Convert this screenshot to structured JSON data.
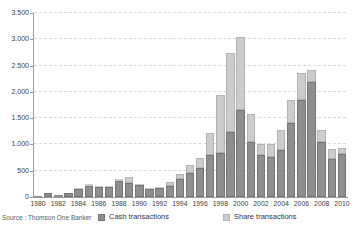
{
  "chart_data": {
    "type": "bar",
    "stacked": true,
    "title": "",
    "xlabel": "",
    "ylabel": "",
    "categories": [
      1980,
      1981,
      1982,
      1983,
      1984,
      1985,
      1986,
      1987,
      1988,
      1989,
      1990,
      1991,
      1992,
      1993,
      1994,
      1995,
      1996,
      1997,
      1998,
      1999,
      2000,
      2001,
      2002,
      2003,
      2004,
      2005,
      2006,
      2007,
      2008,
      2009,
      2010
    ],
    "series": [
      {
        "name": "Cash transactions",
        "color": "#8e8e8e",
        "border_color": "#747474",
        "values": [
          10,
          80,
          30,
          70,
          160,
          205,
          195,
          195,
          310,
          275,
          225,
          145,
          175,
          215,
          345,
          465,
          550,
          800,
          845,
          1230,
          1650,
          1055,
          800,
          770,
          885,
          1410,
          1850,
          2180,
          1040,
          720,
          815
        ]
      },
      {
        "name": "Share transactions",
        "color": "#cccccc",
        "border_color": "#b2b2b2",
        "values": [
          0,
          0,
          0,
          5,
          10,
          35,
          20,
          20,
          35,
          110,
          25,
          20,
          20,
          65,
          95,
          135,
          195,
          415,
          1090,
          1500,
          1400,
          520,
          205,
          240,
          395,
          430,
          510,
          245,
          240,
          195,
          120
        ]
      }
    ],
    "ylim": [
      0,
      3500
    ],
    "yticks": {
      "values": [
        0,
        500,
        1000,
        1500,
        2000,
        2500,
        3000,
        3500
      ],
      "labels": [
        "0",
        "500",
        "1.000",
        "1.500",
        "2.000",
        "2.500",
        "3.000",
        "3.500"
      ]
    },
    "x_tick_step": 2,
    "grid": "horizontal-dashed",
    "legend_position": "bottom",
    "source": "Source : Thomson One Banker"
  }
}
